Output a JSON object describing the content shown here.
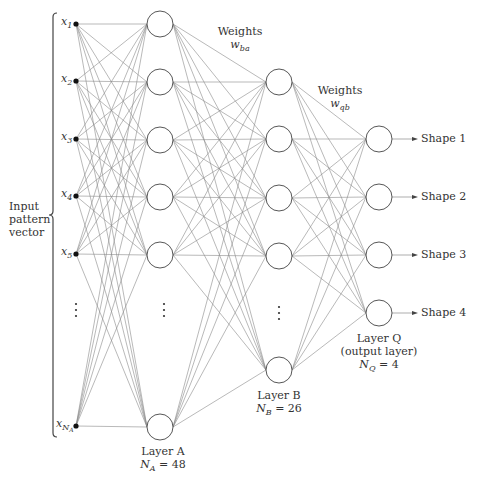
{
  "colors": {
    "line": "#8a8a8a",
    "node": "#444444",
    "text": "#333333",
    "background": "#ffffff"
  },
  "input": {
    "bracket_label": [
      "Input",
      "pattern",
      "vector"
    ],
    "nodes": [
      {
        "label": "x",
        "sub": "1",
        "y": 24
      },
      {
        "label": "x",
        "sub": "2",
        "y": 81
      },
      {
        "label": "x",
        "sub": "3",
        "y": 139
      },
      {
        "label": "x",
        "sub": "4",
        "y": 196
      },
      {
        "label": "x",
        "sub": "5",
        "y": 254
      },
      {
        "label": "x",
        "sub": "N",
        "subsub": "A",
        "y": 426
      }
    ],
    "x": 76,
    "ellipsis_y": 310
  },
  "layer_a": {
    "title": "Layer A",
    "count_label": "N",
    "count_sub": "A",
    "count_value": "= 48",
    "x": 160,
    "r": 13,
    "nodes_y": [
      24,
      82,
      140,
      197,
      255,
      427
    ],
    "ellipsis_y": 310
  },
  "weights_ba": {
    "title": "Weights",
    "symbol": "w",
    "sub": "ba"
  },
  "layer_b": {
    "title": "Layer B",
    "count_label": "N",
    "count_sub": "B",
    "count_value": "= 26",
    "x": 279,
    "r": 13,
    "nodes_y": [
      82,
      139,
      198,
      256,
      370
    ],
    "ellipsis_y": 313
  },
  "weights_qb": {
    "title": "Weights",
    "symbol": "w",
    "sub": "qb"
  },
  "layer_q": {
    "title": "Layer Q",
    "subtitle": "(output layer)",
    "count_label": "N",
    "count_sub": "Q",
    "count_value": "= 4",
    "x": 379,
    "r": 13,
    "nodes_y": [
      139,
      197,
      255,
      313
    ]
  },
  "outputs": [
    {
      "label": "Shape 1"
    },
    {
      "label": "Shape 2"
    },
    {
      "label": "Shape 3"
    },
    {
      "label": "Shape 4"
    }
  ]
}
